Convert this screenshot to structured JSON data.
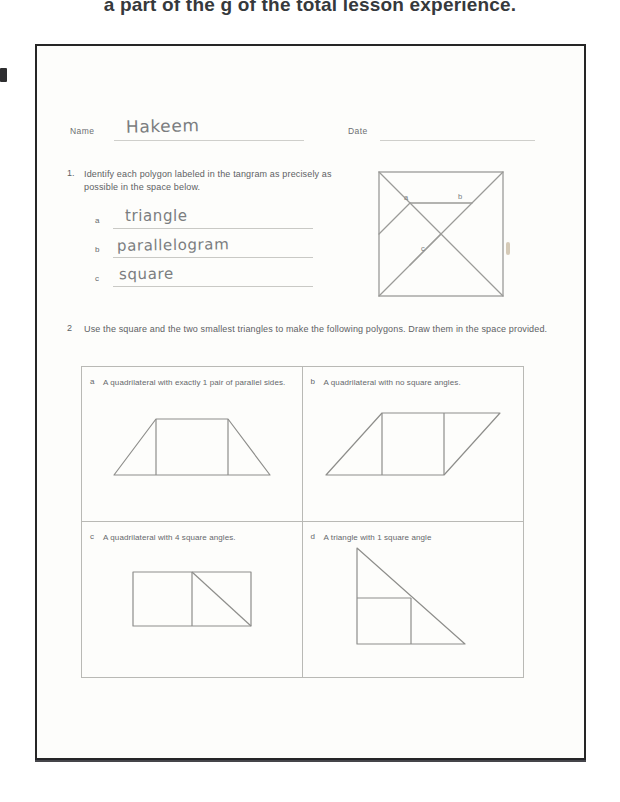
{
  "page": {
    "cropped_header_text": "a part of the  g of the total lesson experience.",
    "background_color": "#ffffff",
    "sheet_border_color": "#262626",
    "ink_color": "#5e6164",
    "pencil_color": "#7b7d80"
  },
  "identification": {
    "name_label": "Name",
    "name_value": "Hakeem",
    "date_label": "Date",
    "date_value": ""
  },
  "question1": {
    "number": "1.",
    "text": "Identify each polygon labeled in the tangram as precisely as possible in the space below.",
    "answers": [
      {
        "letter": "a",
        "value": "triangle"
      },
      {
        "letter": "b",
        "value": "parallelogram"
      },
      {
        "letter": "c",
        "value": "square"
      }
    ],
    "tangram": {
      "labels": [
        "a",
        "b",
        "c"
      ],
      "description": "square tangram outline with seven pieces"
    }
  },
  "question2": {
    "number": "2",
    "text": "Use the square and the two smallest triangles to make the following polygons.  Draw them in the space provided.",
    "cells": [
      {
        "letter": "a",
        "text": "A quadrilateral with exactly 1 pair of parallel sides.",
        "drawing": "trapezoid-from-square-and-two-triangles"
      },
      {
        "letter": "b",
        "text": "A quadrilateral with no square angles.",
        "drawing": "parallelogram-from-square-and-two-triangles"
      },
      {
        "letter": "c",
        "text": "A quadrilateral with 4 square angles.",
        "drawing": "rectangle-from-square-and-two-triangles"
      },
      {
        "letter": "d",
        "text": "A triangle with 1 square angle",
        "drawing": "right-triangle-from-square-and-two-triangles"
      }
    ]
  }
}
